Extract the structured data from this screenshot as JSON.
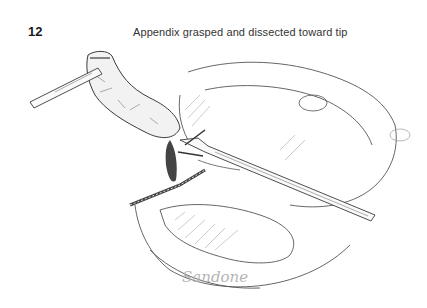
{
  "figure": {
    "number": "12",
    "caption": "Appendix grasped and dissected toward tip",
    "signature": "Sandone"
  },
  "illustration": {
    "subject": "laparoscopic appendectomy",
    "elements": [
      "grasper-instrument",
      "appendix",
      "dissector-instrument",
      "cecum",
      "stapler-line"
    ],
    "line_color": "#3a3a3a",
    "shade_color": "#8a8a8a"
  }
}
